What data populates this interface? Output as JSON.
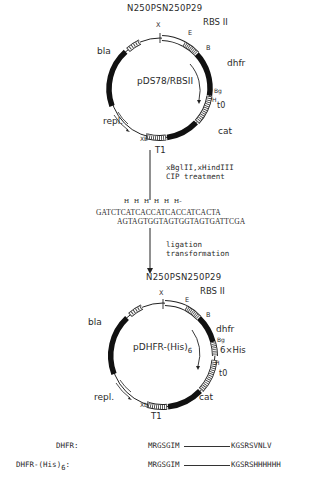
{
  "top_plasmid": {
    "name": "pDS78/RBSII",
    "promoter_label": "N250PSN250P29",
    "rbs_label": "RBS II",
    "genes": [
      "bla",
      "dhfr",
      "cat",
      "repl."
    ],
    "sites": [
      "X",
      "E",
      "B",
      "Bg",
      "H",
      "Xb"
    ],
    "terminators": [
      "t0",
      "T1"
    ]
  },
  "step1": {
    "line1": "xBglII,xHindIII",
    "line2": "CIP treatment"
  },
  "linker": {
    "his_row": "H  H  H  H  H  H-",
    "top_strand": "GATCTCATCACCATCACCATCACTA",
    "bottom_strand": "AGTAGTGGTAGTGGTAGTGATTCGA"
  },
  "step2": {
    "line1": "ligation",
    "line2": "transformation"
  },
  "bottom_plasmid": {
    "name": "pDHFR-(His)",
    "name_sub": "6",
    "promoter_label": "N250PSN250P29",
    "rbs_label": "RBS II",
    "genes": [
      "bla",
      "dhfr",
      "cat",
      "repl."
    ],
    "his_tag": "6×His",
    "sites": [
      "X",
      "E",
      "B",
      "Bg",
      "H",
      "Xb"
    ],
    "terminators": [
      "t0",
      "T1"
    ]
  },
  "sequences": [
    {
      "label": "DHFR:",
      "nterm": "MRGSGIM",
      "cterm": "KGSRSVNLV"
    },
    {
      "label": "DHFR-(His)",
      "label_sub": "6",
      "label_suffix": ":",
      "nterm": "MRGSGIM",
      "cterm": "KGSRSHHHHHH"
    }
  ],
  "colors": {
    "ink": "#1a1a1a",
    "background": "#ffffff"
  }
}
